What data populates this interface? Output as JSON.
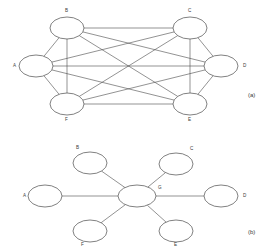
{
  "figure": {
    "background_color": "#ffffff",
    "stroke_color": "#4a4a4a",
    "text_color": "#3a3a3a",
    "panels": [
      {
        "id": "panel-a",
        "caption": "(a)",
        "topology": "full-mesh",
        "caption_x": 248,
        "caption_y": 97,
        "nodes": [
          {
            "id": "A",
            "label": "A",
            "cx": 36,
            "cy": 66,
            "rx": 17,
            "ry": 11,
            "label_x": 13,
            "label_y": 67
          },
          {
            "id": "B",
            "label": "B",
            "cx": 67,
            "cy": 28,
            "rx": 17,
            "ry": 11,
            "label_x": 65,
            "label_y": 12
          },
          {
            "id": "C",
            "label": "C",
            "cx": 190,
            "cy": 28,
            "rx": 17,
            "ry": 11,
            "label_x": 188,
            "label_y": 12
          },
          {
            "id": "D",
            "label": "D",
            "cx": 221,
            "cy": 66,
            "rx": 17,
            "ry": 11,
            "label_x": 243,
            "label_y": 67
          },
          {
            "id": "E",
            "label": "E",
            "cx": 190,
            "cy": 104,
            "rx": 17,
            "ry": 11,
            "label_x": 188,
            "label_y": 121
          },
          {
            "id": "F",
            "label": "F",
            "cx": 67,
            "cy": 104,
            "rx": 17,
            "ry": 11,
            "label_x": 65,
            "label_y": 121
          }
        ],
        "edges": [
          [
            "A",
            "B"
          ],
          [
            "A",
            "C"
          ],
          [
            "A",
            "D"
          ],
          [
            "A",
            "E"
          ],
          [
            "A",
            "F"
          ],
          [
            "B",
            "C"
          ],
          [
            "B",
            "D"
          ],
          [
            "B",
            "E"
          ],
          [
            "B",
            "F"
          ],
          [
            "C",
            "D"
          ],
          [
            "C",
            "E"
          ],
          [
            "C",
            "F"
          ],
          [
            "D",
            "E"
          ],
          [
            "D",
            "F"
          ],
          [
            "E",
            "F"
          ]
        ],
        "edge_count": 15
      },
      {
        "id": "panel-b",
        "caption": "(b)",
        "topology": "star",
        "caption_x": 248,
        "caption_y": 234,
        "nodes": [
          {
            "id": "G",
            "label": "G",
            "cx": 137,
            "cy": 196,
            "rx": 19,
            "ry": 11,
            "label_x": 158,
            "label_y": 189
          },
          {
            "id": "A",
            "label": "A",
            "cx": 45,
            "cy": 196,
            "rx": 17,
            "ry": 11,
            "label_x": 23,
            "label_y": 197
          },
          {
            "id": "B",
            "label": "B",
            "cx": 90,
            "cy": 163,
            "rx": 17,
            "ry": 11,
            "label_x": 76,
            "label_y": 149
          },
          {
            "id": "C",
            "label": "C",
            "cx": 176,
            "cy": 164,
            "rx": 17,
            "ry": 11,
            "label_x": 190,
            "label_y": 150
          },
          {
            "id": "D",
            "label": "D",
            "cx": 221,
            "cy": 196,
            "rx": 17,
            "ry": 11,
            "label_x": 243,
            "label_y": 197
          },
          {
            "id": "E",
            "label": "E",
            "cx": 176,
            "cy": 231,
            "rx": 17,
            "ry": 11,
            "label_x": 174,
            "label_y": 246
          },
          {
            "id": "F",
            "label": "F",
            "cx": 90,
            "cy": 231,
            "rx": 17,
            "ry": 11,
            "label_x": 81,
            "label_y": 246
          }
        ],
        "edges": [
          [
            "G",
            "A"
          ],
          [
            "G",
            "B"
          ],
          [
            "G",
            "C"
          ],
          [
            "G",
            "D"
          ],
          [
            "G",
            "E"
          ],
          [
            "G",
            "F"
          ]
        ],
        "edge_count": 6
      }
    ]
  }
}
